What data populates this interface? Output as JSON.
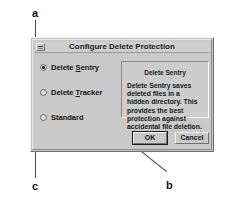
{
  "figure": {
    "callouts": [
      {
        "id": "a",
        "label": "a",
        "points_to": "delete-sentry-radio"
      },
      {
        "id": "b",
        "label": "b",
        "points_to": "description-groupbox"
      },
      {
        "id": "c",
        "label": "c",
        "points_to": "standard-radio"
      }
    ]
  },
  "dialog": {
    "title": "Configure Delete Protection",
    "system_menu_icon": "system-menu-icon",
    "options": [
      {
        "label": "Delete Sentry",
        "accel": "S",
        "selected": true
      },
      {
        "label": "Delete Tracker",
        "accel": "T",
        "selected": false
      },
      {
        "label": "Standard",
        "accel": "",
        "selected": false
      }
    ],
    "description": {
      "heading": "Delete Sentry",
      "body": "Delete Sentry saves deleted files in a hidden directory.  This provides the best protection against accidental file deletion."
    },
    "buttons": {
      "ok": "OK",
      "cancel": "Cancel"
    }
  },
  "colors": {
    "dialog_face": "#c9c9c9",
    "dialog_shadow": "#6e6e6e",
    "dialog_highlight": "#f2f2f2",
    "text": "#141414",
    "leader_line": "#3c3c3c"
  }
}
